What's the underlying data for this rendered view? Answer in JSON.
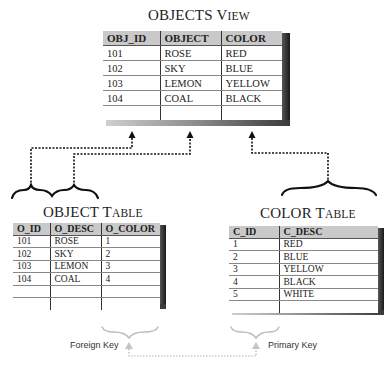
{
  "objects_view": {
    "title_main": "OBJECTS V",
    "title_sc": "IEW",
    "columns": [
      "OBJ_ID",
      "OBJECT",
      "COLOR"
    ],
    "rows": [
      [
        "101",
        "ROSE",
        "RED"
      ],
      [
        "102",
        "SKY",
        "BLUE"
      ],
      [
        "103",
        "LEMON",
        "YELLOW"
      ],
      [
        "104",
        "COAL",
        "BLACK"
      ],
      [
        "",
        "",
        ""
      ]
    ]
  },
  "object_table": {
    "title_main": "OBJECT T",
    "title_sc": "ABLE",
    "columns": [
      "O_ID",
      "O_DESC",
      "O_COLOR"
    ],
    "rows": [
      [
        "101",
        "ROSE",
        "1"
      ],
      [
        "102",
        "SKY",
        "2"
      ],
      [
        "103",
        "LEMON",
        "3"
      ],
      [
        "104",
        "COAL",
        "4"
      ],
      [
        "",
        "",
        ""
      ],
      [
        "",
        "",
        ""
      ]
    ]
  },
  "color_table": {
    "title_main": "COLOR T",
    "title_sc": "ABLE",
    "columns": [
      "C_ID",
      "C_DESC"
    ],
    "rows": [
      [
        "1",
        "RED"
      ],
      [
        "2",
        "BLUE"
      ],
      [
        "3",
        "YELLOW"
      ],
      [
        "4",
        "BLACK"
      ],
      [
        "5",
        "WHITE"
      ],
      [
        "",
        ""
      ]
    ]
  },
  "labels": {
    "foreign_key": "Foreign Key",
    "primary_key": "Primary Key"
  },
  "colors": {
    "header_bg": "#c9c9c9",
    "shadow": "#1a1a1a",
    "connector": "#111111",
    "key_relation": "#b5b5b5"
  }
}
